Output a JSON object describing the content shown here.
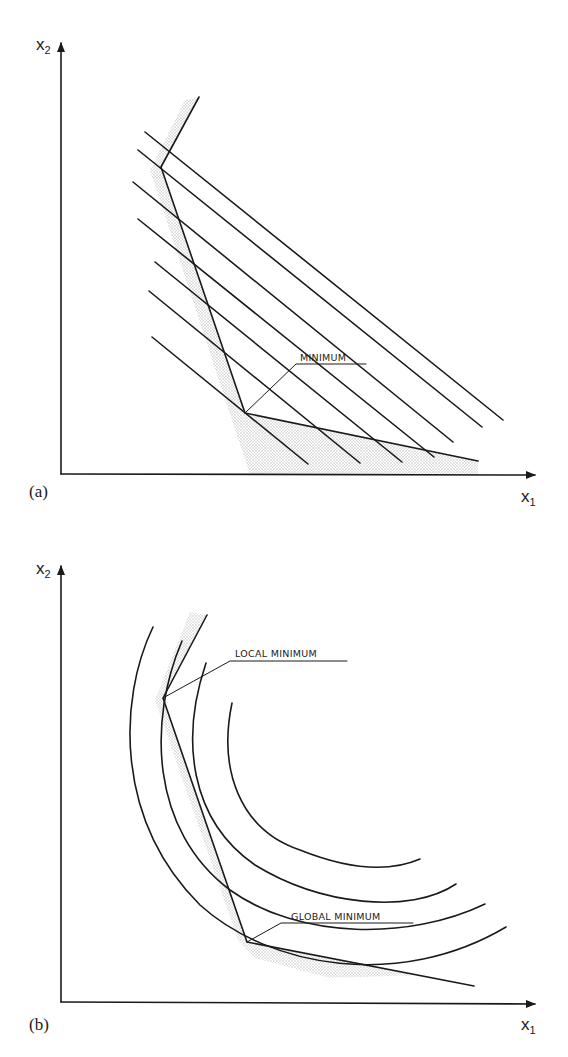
{
  "figure_a": {
    "panel_label": "(a)",
    "axis_x_label": "x",
    "axis_x_sub": "1",
    "axis_y_label": "x",
    "axis_y_sub": "2",
    "annotation": "MINIMUM",
    "objective_contours": "parallel straight lines (linear objective)",
    "feasible_region": "shaded boundary along two linear constraints"
  },
  "figure_b": {
    "panel_label": "(b)",
    "axis_x_label": "x",
    "axis_x_sub": "1",
    "axis_y_label": "x",
    "axis_y_sub": "2",
    "annotation_local": "LOCAL MINIMUM",
    "annotation_global": "GLOBAL MINIMUM",
    "objective_contours": "concentric curved arcs (nonlinear objective)",
    "feasible_region": "shaded boundary along two linear constraints"
  },
  "colors": {
    "ink": "#1a1a1a",
    "shade": "#b0b0b0",
    "background": "#ffffff"
  }
}
